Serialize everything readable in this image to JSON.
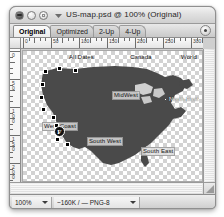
{
  "window": {
    "title": "US-map.psd @ 100% (Original)",
    "controls": {
      "close": "close-button",
      "minimize": "minimize-button",
      "zoom": "zoom-button"
    },
    "proxy_icon": "document-proxy-icon"
  },
  "tabs": [
    {
      "label": "Original",
      "active": true
    },
    {
      "label": "Optimized",
      "active": false
    },
    {
      "label": "2-Up",
      "active": false
    },
    {
      "label": "4-Up",
      "active": false
    }
  ],
  "tab_menu_button": "panel-menu-button",
  "rulers": {
    "unit_corner": "ruler-origin-box",
    "horizontal": [
      "0",
      "50",
      "100",
      "150",
      "200",
      "250",
      "300"
    ],
    "vertical": [
      "0",
      "50",
      "100",
      "150",
      "200"
    ]
  },
  "canvas": {
    "map_name": "united-states-map",
    "map_fill": "#4a4a4a",
    "regions": [
      {
        "name": "all-dates",
        "label": "All Dates",
        "x": 46,
        "y": 4,
        "style": "plain"
      },
      {
        "name": "canada",
        "label": "Canada",
        "x": 107,
        "y": 4,
        "style": "plain"
      },
      {
        "name": "world",
        "label": "World",
        "x": 158,
        "y": 4,
        "style": "plain"
      },
      {
        "name": "mid-west",
        "label": "MidWest",
        "x": 89,
        "y": 41,
        "style": "chip"
      },
      {
        "name": "north-east",
        "label": "North East",
        "x": 146,
        "y": 46,
        "style": "light"
      },
      {
        "name": "west-coast",
        "label": "West Coast",
        "x": 21,
        "y": 72,
        "style": "chip"
      },
      {
        "name": "south-west",
        "label": "South West",
        "x": 64,
        "y": 87,
        "style": "chip"
      },
      {
        "name": "south-east",
        "label": "South East",
        "x": 118,
        "y": 97,
        "style": "chip"
      }
    ],
    "badge": {
      "name": "frame-badge-f",
      "label": "F",
      "x": 31,
      "y": 75
    },
    "anchors": [
      {
        "x": 22,
        "y": 20
      },
      {
        "x": 36,
        "y": 17
      },
      {
        "x": 52,
        "y": 19
      },
      {
        "x": 19,
        "y": 33
      },
      {
        "x": 18,
        "y": 46
      },
      {
        "x": 20,
        "y": 58
      },
      {
        "x": 30,
        "y": 66
      },
      {
        "x": 33,
        "y": 74
      },
      {
        "x": 34,
        "y": 88
      },
      {
        "x": 44,
        "y": 93
      }
    ]
  },
  "status": {
    "zoom_level": "100%",
    "file_info": "~160K / — PNG-8",
    "zoom_menu": "zoom-level-menu",
    "info_menu": "optimization-info-menu"
  }
}
